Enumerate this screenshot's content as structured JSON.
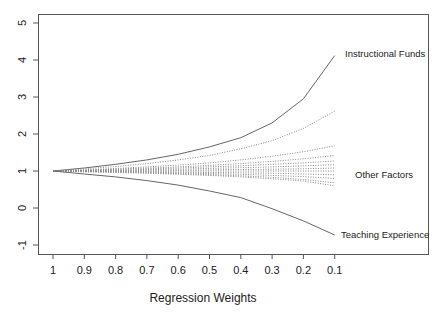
{
  "chart_data": {
    "type": "line",
    "title": "",
    "xlabel": "Regression Weights",
    "ylabel": "",
    "x": [
      1,
      0.9,
      0.8,
      0.7,
      0.6,
      0.5,
      0.4,
      0.3,
      0.2,
      0.1
    ],
    "x_tick_labels": [
      "1",
      "0.9",
      "0.8",
      "0.7",
      "0.6",
      "0.5",
      "0.4",
      "0.3",
      "0.2",
      "0.1"
    ],
    "y_ticks": [
      -1,
      0,
      1,
      2,
      3,
      4,
      5
    ],
    "y_tick_labels": [
      "-1",
      "0",
      "1",
      "2",
      "3",
      "4",
      "5"
    ],
    "ylim": [
      -1.25,
      5.25
    ],
    "grid": false,
    "annotations": [
      {
        "text": "Instructional Funds",
        "x": 0.1,
        "y": 4.1
      },
      {
        "text": "Other Factors",
        "x": 0.1,
        "y": 1.0
      },
      {
        "text": "Teaching Experience",
        "x": 0.1,
        "y": -0.75
      }
    ],
    "series": [
      {
        "name": "Instructional Funds",
        "style": "solid",
        "values": [
          1.0,
          1.08,
          1.18,
          1.3,
          1.45,
          1.65,
          1.9,
          2.3,
          2.95,
          4.12
        ]
      },
      {
        "name": "Other Factor A",
        "style": "dotted",
        "values": [
          1.0,
          1.06,
          1.12,
          1.2,
          1.3,
          1.42,
          1.6,
          1.82,
          2.15,
          2.62
        ]
      },
      {
        "name": "Other Factor B",
        "style": "dotted",
        "values": [
          1.0,
          1.03,
          1.07,
          1.11,
          1.16,
          1.22,
          1.3,
          1.4,
          1.52,
          1.68
        ]
      },
      {
        "name": "Other Factor C",
        "style": "dotted",
        "values": [
          1.0,
          1.02,
          1.05,
          1.08,
          1.11,
          1.15,
          1.2,
          1.26,
          1.33,
          1.42
        ]
      },
      {
        "name": "Other Factor D",
        "style": "dotted",
        "values": [
          1.0,
          1.02,
          1.04,
          1.06,
          1.08,
          1.11,
          1.14,
          1.18,
          1.22,
          1.27
        ]
      },
      {
        "name": "Other Factor E",
        "style": "dotted",
        "values": [
          1.0,
          1.01,
          1.02,
          1.04,
          1.05,
          1.07,
          1.09,
          1.11,
          1.14,
          1.17
        ]
      },
      {
        "name": "Other Factor F",
        "style": "dotted",
        "values": [
          1.0,
          1.0,
          1.01,
          1.02,
          1.02,
          1.03,
          1.04,
          1.05,
          1.06,
          1.08
        ]
      },
      {
        "name": "Other Factor G",
        "style": "dotted",
        "values": [
          1.0,
          1.0,
          1.0,
          1.0,
          1.0,
          1.0,
          1.0,
          1.0,
          1.0,
          1.0
        ]
      },
      {
        "name": "Other Factor H",
        "style": "dotted",
        "values": [
          1.0,
          0.99,
          0.99,
          0.98,
          0.97,
          0.96,
          0.95,
          0.94,
          0.92,
          0.9
        ]
      },
      {
        "name": "Other Factor I",
        "style": "dotted",
        "values": [
          1.0,
          0.99,
          0.98,
          0.97,
          0.95,
          0.93,
          0.91,
          0.88,
          0.85,
          0.8
        ]
      },
      {
        "name": "Other Factor J",
        "style": "dotted",
        "values": [
          1.0,
          0.98,
          0.97,
          0.95,
          0.93,
          0.9,
          0.87,
          0.83,
          0.77,
          0.68
        ]
      },
      {
        "name": "Other Factor K",
        "style": "dotted",
        "values": [
          1.0,
          0.98,
          0.96,
          0.94,
          0.91,
          0.88,
          0.84,
          0.79,
          0.73,
          0.6
        ]
      },
      {
        "name": "Teaching Experience",
        "style": "solid",
        "values": [
          1.0,
          0.92,
          0.84,
          0.74,
          0.62,
          0.46,
          0.28,
          -0.02,
          -0.35,
          -0.73
        ]
      }
    ]
  }
}
